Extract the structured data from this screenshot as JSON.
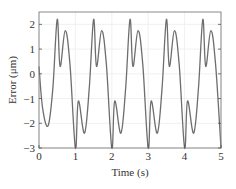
{
  "chart_data": {
    "type": "line",
    "title": "",
    "xlabel": "Time (s)",
    "ylabel": "Error (μm)",
    "xlim": [
      0,
      5
    ],
    "ylim": [
      -3,
      2.5
    ],
    "xticks": [
      0,
      1,
      2,
      3,
      4,
      5
    ],
    "xtick_labels": [
      "0",
      "1",
      "2",
      "3",
      "4",
      "5"
    ],
    "yticks": [
      -3,
      -2,
      -1,
      0,
      1,
      2
    ],
    "ytick_labels": [
      "−3",
      "−2",
      "−1",
      "0",
      "1",
      "2"
    ],
    "grid": true,
    "line_color": "#6e6e6e",
    "series": [
      {
        "name": "Error",
        "x": [
          0,
          0.1,
          0.25,
          0.38,
          0.5,
          0.58,
          0.72,
          0.85,
          1.0,
          1.08,
          1.25,
          1.38,
          1.5,
          1.58,
          1.72,
          1.85,
          2.0,
          2.08,
          2.25,
          2.38,
          2.5,
          2.58,
          2.72,
          2.85,
          3.0,
          3.08,
          3.25,
          3.38,
          3.5,
          3.58,
          3.72,
          3.85,
          4.0,
          4.08,
          4.25,
          4.38,
          4.5,
          4.58,
          4.72,
          4.85,
          5.0
        ],
        "y": [
          0.3,
          -1.4,
          -2.1,
          -0.6,
          2.2,
          0.3,
          1.75,
          0.4,
          -3.0,
          -1.1,
          -2.4,
          -0.6,
          2.2,
          0.3,
          1.75,
          0.4,
          -3.0,
          -1.1,
          -2.4,
          -0.6,
          2.2,
          0.3,
          1.75,
          0.4,
          -3.0,
          -1.1,
          -2.4,
          -0.6,
          2.2,
          0.3,
          1.75,
          0.4,
          -3.0,
          -1.1,
          -2.4,
          -0.6,
          2.2,
          0.3,
          1.75,
          0.4,
          -3.0
        ]
      }
    ]
  }
}
